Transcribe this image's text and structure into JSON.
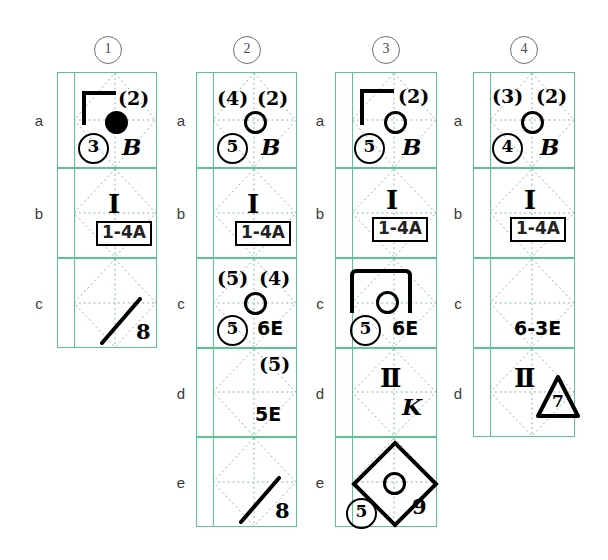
{
  "diagram": {
    "title_columns": [
      "1",
      "2",
      "3",
      "4"
    ],
    "row_labels": [
      "a",
      "b",
      "c",
      "d",
      "e"
    ],
    "grid_color": "#5cc48f",
    "ink_color": "#000000",
    "columns": [
      {
        "header": "1",
        "rows": [
          {
            "row": "a",
            "marks": {
              "top_left": "",
              "top_right": "(2)",
              "bottom_left": "3",
              "bottom_right": "B",
              "token": "filled-circle",
              "bracket": "corner",
              "extra": ""
            }
          },
          {
            "row": "b",
            "marks": {
              "center": "I",
              "boxed": "1-4A"
            }
          },
          {
            "row": "c",
            "marks": {
              "slash": "slash",
              "slash_number": "8"
            }
          }
        ]
      },
      {
        "header": "2",
        "rows": [
          {
            "row": "a",
            "marks": {
              "top_left": "(4)",
              "top_right": "(2)",
              "bottom_left": "5",
              "bottom_right": "B",
              "token": "open-circle"
            }
          },
          {
            "row": "b",
            "marks": {
              "center": "I",
              "boxed": "1-4A"
            }
          },
          {
            "row": "c",
            "marks": {
              "top_left": "(5)",
              "top_right": "(4)",
              "bottom_left": "5",
              "bottom_right": "6E",
              "token": "open-circle"
            }
          },
          {
            "row": "d",
            "marks": {
              "top_right": "(5)",
              "bottom_right": "5E"
            }
          },
          {
            "row": "e",
            "marks": {
              "slash": "slash",
              "slash_number": "8"
            }
          }
        ]
      },
      {
        "header": "3",
        "rows": [
          {
            "row": "a",
            "marks": {
              "top_right": "(2)",
              "bottom_left": "5",
              "bottom_right": "B",
              "token": "open-circle",
              "bracket": "corner"
            }
          },
          {
            "row": "b",
            "marks": {
              "center": "I",
              "boxed": "1-4A"
            }
          },
          {
            "row": "c",
            "marks": {
              "bottom_left": "5",
              "bottom_right": "6E",
              "token": "open-circle",
              "bracket": "wide"
            }
          },
          {
            "row": "d",
            "marks": {
              "center": "II",
              "bottom_right": "K"
            }
          },
          {
            "row": "e",
            "marks": {
              "diamond": "big-diamond",
              "token": "open-circle",
              "bottom_left": "5",
              "bottom_right": "9"
            }
          }
        ]
      },
      {
        "header": "4",
        "rows": [
          {
            "row": "a",
            "marks": {
              "top_left": "(3)",
              "top_right": "(2)",
              "bottom_left": "4",
              "bottom_right": "B",
              "token": "open-circle"
            }
          },
          {
            "row": "b",
            "marks": {
              "center": "I",
              "boxed": "1-4A"
            }
          },
          {
            "row": "c",
            "marks": {
              "bottom_right": "6-3E"
            }
          },
          {
            "row": "d",
            "marks": {
              "center": "II",
              "triangle_number": "7"
            }
          }
        ]
      }
    ]
  }
}
